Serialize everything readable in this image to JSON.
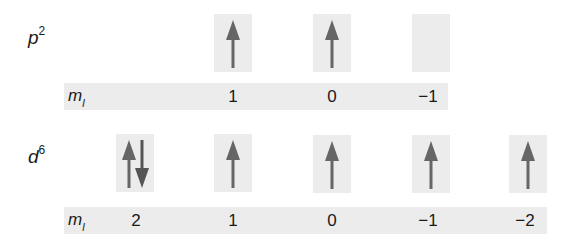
{
  "colors": {
    "box_fill": "#ececec",
    "arrow": "#666666",
    "text": "#1a1a1a"
  },
  "rows": [
    {
      "config": {
        "letter": "p",
        "superscript": "2"
      },
      "ml_label": {
        "m": "m",
        "sub": "l"
      },
      "orbitals": [
        {
          "ml": "1",
          "electrons": "up"
        },
        {
          "ml": "0",
          "electrons": "up"
        },
        {
          "ml": "−1",
          "electrons": "empty"
        }
      ]
    },
    {
      "config": {
        "letter": "d",
        "superscript": "6"
      },
      "ml_label": {
        "m": "m",
        "sub": "l"
      },
      "orbitals": [
        {
          "ml": "2",
          "electrons": "up-down"
        },
        {
          "ml": "1",
          "electrons": "up"
        },
        {
          "ml": "0",
          "electrons": "up"
        },
        {
          "ml": "−1",
          "electrons": "up"
        },
        {
          "ml": "−2",
          "electrons": "up"
        }
      ]
    }
  ]
}
